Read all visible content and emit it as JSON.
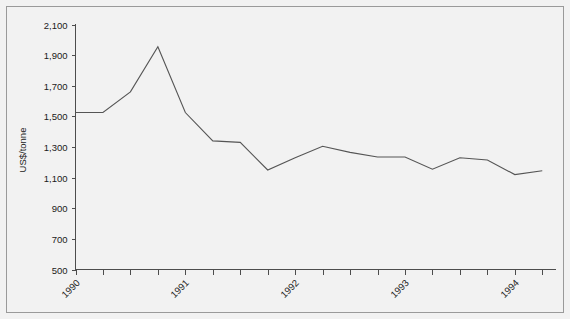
{
  "chart_data": {
    "type": "line",
    "title": "",
    "subtitle": "",
    "xlabel": "",
    "ylabel": "US$/tonne",
    "ylim": [
      500,
      2100
    ],
    "ytick_values": [
      500,
      700,
      900,
      1100,
      1300,
      1500,
      1700,
      1900,
      2100
    ],
    "ytick_labels": [
      "500",
      "700",
      "900",
      "1,100",
      "1,300",
      "1,500",
      "1,700",
      "1,900",
      "2,100"
    ],
    "xlim": [
      1990.0,
      1994.375
    ],
    "xtick_labels": [
      "1990",
      "",
      "",
      "",
      "1991",
      "",
      "",
      "",
      "1992",
      "",
      "",
      "",
      "1993",
      "",
      "",
      "",
      "1994",
      ""
    ],
    "xtick_major_labels": [
      "1990",
      "1991",
      "1992",
      "1993",
      "1994"
    ],
    "x": [
      1990.0,
      1990.25,
      1990.5,
      1990.75,
      1991.0,
      1991.25,
      1991.5,
      1991.75,
      1992.0,
      1992.25,
      1992.5,
      1992.75,
      1993.0,
      1993.25,
      1993.5,
      1993.75,
      1994.0,
      1994.25
    ],
    "values": [
      1525,
      1525,
      1660,
      1955,
      1525,
      1340,
      1330,
      1150,
      1230,
      1305,
      1265,
      1235,
      1235,
      1155,
      1230,
      1215,
      1120,
      1145
    ],
    "grid": false,
    "legend": false,
    "series": [
      {
        "name": "US$/tonne",
        "color": "#555555",
        "values": [
          1525,
          1525,
          1660,
          1955,
          1525,
          1340,
          1330,
          1150,
          1230,
          1305,
          1265,
          1235,
          1235,
          1155,
          1230,
          1215,
          1120,
          1145
        ]
      }
    ]
  },
  "chart": {
    "y_axis_title": "US$/tonne",
    "background_color": "#f2f2f2",
    "line_color": "#555555",
    "axis_color": "#4d4d4d",
    "frame_color": "#9a9a9a"
  }
}
